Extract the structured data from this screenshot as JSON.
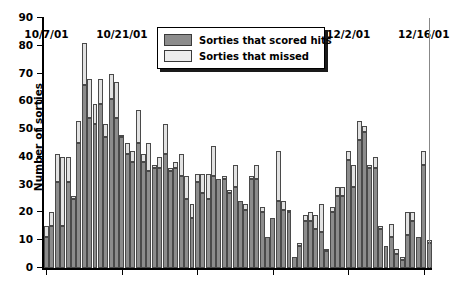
{
  "chart_data": {
    "type": "bar",
    "subtype": "stacked",
    "title": "",
    "xlabel": "",
    "ylabel": "Number of sorties",
    "ylim": [
      0,
      90
    ],
    "ytick_values": [
      0,
      10,
      20,
      30,
      40,
      50,
      60,
      70,
      80,
      90
    ],
    "ytick_labels": [
      "0",
      "10",
      "20",
      "30",
      "40",
      "50",
      "60",
      "70",
      "80",
      "90"
    ],
    "xtick_labels": [
      "10/7/01",
      "10/21/01",
      "11/4/01",
      "11/18/01",
      "12/2/01",
      "12/16/01"
    ],
    "xtick_indices": [
      0,
      14,
      28,
      42,
      56,
      70
    ],
    "grid": false,
    "legend_position": "top-center",
    "colors": {
      "hits": "#8c8c8c",
      "missed": "#e2e2e2",
      "edge": "#4a4a4a",
      "axis": "#000000",
      "background": "#ffffff"
    },
    "categories": [
      "10/7/01",
      "10/8/01",
      "10/9/01",
      "10/10/01",
      "10/11/01",
      "10/12/01",
      "10/13/01",
      "10/14/01",
      "10/15/01",
      "10/16/01",
      "10/17/01",
      "10/18/01",
      "10/19/01",
      "10/20/01",
      "10/21/01",
      "10/22/01",
      "10/23/01",
      "10/24/01",
      "10/25/01",
      "10/26/01",
      "10/27/01",
      "10/28/01",
      "10/29/01",
      "10/30/01",
      "10/31/01",
      "11/1/01",
      "11/2/01",
      "11/3/01",
      "11/4/01",
      "11/5/01",
      "11/6/01",
      "11/7/01",
      "11/8/01",
      "11/9/01",
      "11/10/01",
      "11/11/01",
      "11/12/01",
      "11/13/01",
      "11/14/01",
      "11/15/01",
      "11/16/01",
      "11/17/01",
      "11/18/01",
      "11/19/01",
      "11/20/01",
      "11/21/01",
      "11/22/01",
      "11/23/01",
      "11/24/01",
      "11/25/01",
      "11/26/01",
      "11/27/01",
      "11/28/01",
      "11/29/01",
      "11/30/01",
      "12/1/01",
      "12/2/01",
      "12/3/01",
      "12/4/01",
      "12/5/01",
      "12/6/01",
      "12/7/01",
      "12/8/01",
      "12/9/01",
      "12/10/01",
      "12/11/01",
      "12/12/01",
      "12/13/01",
      "12/14/01",
      "12/15/01",
      "12/16/01",
      "12/17/01"
    ],
    "series": [
      {
        "name": "Sorties that scored hits",
        "key": "hits",
        "color": "#8c8c8c",
        "values": [
          11,
          15,
          31,
          15,
          31,
          25,
          45,
          66,
          54,
          52,
          59,
          47,
          61,
          54,
          47,
          41,
          38,
          45,
          38,
          35,
          36,
          36,
          41,
          35,
          36,
          33,
          25,
          18,
          31,
          27,
          25,
          33,
          32,
          32,
          27,
          29,
          24,
          21,
          32,
          32,
          20,
          11,
          18,
          24,
          21,
          20,
          4,
          8,
          17,
          17,
          14,
          13,
          6,
          20,
          26,
          26,
          39,
          29,
          46,
          49,
          36,
          36,
          14,
          8,
          11,
          5,
          3,
          12,
          17,
          11,
          37,
          9
        ]
      },
      {
        "name": "Sorties that missed",
        "key": "missed",
        "color": "#e2e2e2",
        "values": [
          4,
          5,
          10,
          25,
          9,
          1,
          8,
          15,
          14,
          7,
          9,
          5,
          9,
          13,
          1,
          4,
          4,
          12,
          3,
          10,
          1,
          4,
          11,
          1,
          2,
          8,
          8,
          5,
          3,
          7,
          9,
          11,
          0,
          1,
          1,
          8,
          0,
          2,
          1,
          5,
          2,
          0,
          0,
          18,
          3,
          1,
          0,
          1,
          2,
          3,
          5,
          10,
          1,
          2,
          3,
          3,
          3,
          8,
          7,
          2,
          1,
          4,
          1,
          0,
          5,
          2,
          1,
          8,
          3,
          0,
          5,
          1
        ]
      }
    ],
    "totals": [
      15,
      20,
      41,
      40,
      40,
      26,
      53,
      81,
      68,
      59,
      68,
      52,
      70,
      67,
      48,
      45,
      42,
      57,
      41,
      45,
      37,
      40,
      52,
      36,
      38,
      41,
      33,
      23,
      34,
      34,
      34,
      44,
      32,
      33,
      28,
      37,
      24,
      23,
      33,
      37,
      22,
      11,
      18,
      42,
      24,
      21,
      4,
      9,
      19,
      20,
      19,
      23,
      7,
      22,
      29,
      29,
      42,
      37,
      53,
      51,
      37,
      40,
      15,
      8,
      16,
      7,
      4,
      20,
      20,
      11,
      42,
      10
    ]
  },
  "legend": {
    "items": [
      {
        "label": "Sorties that scored hits",
        "swatch": "hits"
      },
      {
        "label": "Sorties that missed",
        "swatch": "missed"
      }
    ]
  }
}
